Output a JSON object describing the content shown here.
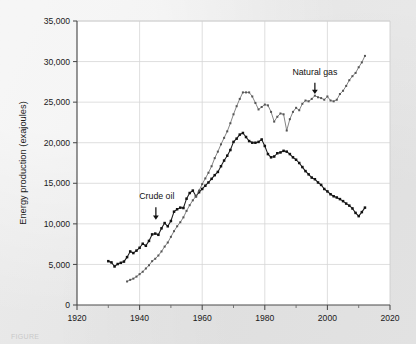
{
  "figure": {
    "background_color": "#e9e9e9",
    "plot_background_color": "#ffffff",
    "caption_fragment": "FIGURE"
  },
  "chart_data": {
    "type": "line",
    "title": "",
    "xlabel": "",
    "ylabel": "Energy production (exajoules)",
    "xlim": [
      1920,
      2020
    ],
    "ylim": [
      0,
      35000
    ],
    "xticks": [
      1920,
      1940,
      1960,
      1980,
      2000,
      2020
    ],
    "xtick_labels": [
      "1920",
      "1940",
      "1960",
      "1980",
      "2000",
      "2020"
    ],
    "xminor_ticks": [
      1930,
      1950,
      1970,
      1990,
      2010
    ],
    "yticks": [
      0,
      5000,
      10000,
      15000,
      20000,
      25000,
      30000,
      35000
    ],
    "ytick_labels": [
      "0",
      "5,000",
      "10,000",
      "15,000",
      "20,000",
      "25,000",
      "30,000",
      "35,000"
    ],
    "grid": "horizontal-and-vertical",
    "legend": "none",
    "marker": "square",
    "annotations": [
      {
        "label": "Crude oil",
        "text_x": 1945.5,
        "text_y": 13050,
        "arrow_from_y": 12050,
        "arrow_to_x": 1945.2,
        "arrow_to_y": 10500,
        "color": "#111111"
      },
      {
        "label": "Natural gas",
        "text_x": 1996.0,
        "text_y": 28300,
        "arrow_from_y": 27400,
        "arrow_to_x": 1996.0,
        "arrow_to_y": 26000,
        "color": "#111111"
      }
    ],
    "series": [
      {
        "name": "Crude oil",
        "color": "#1b1b1b",
        "marker_color": "#111111",
        "x": [
          1930,
          1931,
          1932,
          1933,
          1934,
          1935,
          1936,
          1937,
          1938,
          1939,
          1940,
          1941,
          1942,
          1943,
          1944,
          1945,
          1946,
          1947,
          1948,
          1949,
          1950,
          1951,
          1952,
          1953,
          1954,
          1955,
          1956,
          1957,
          1958,
          1959,
          1960,
          1961,
          1962,
          1963,
          1964,
          1965,
          1966,
          1967,
          1968,
          1969,
          1970,
          1971,
          1972,
          1973,
          1974,
          1975,
          1976,
          1977,
          1978,
          1979,
          1980,
          1981,
          1982,
          1983,
          1984,
          1985,
          1986,
          1987,
          1988,
          1989,
          1990,
          1991,
          1992,
          1993,
          1994,
          1995,
          1996,
          1997,
          1998,
          1999,
          2000,
          2001,
          2002,
          2003,
          2004,
          2005,
          2006,
          2007,
          2008,
          2009,
          2010,
          2011,
          2012
        ],
        "values": [
          5400,
          5250,
          4750,
          5050,
          5200,
          5350,
          5900,
          6600,
          6400,
          6700,
          7050,
          7550,
          7300,
          7900,
          8700,
          8800,
          8650,
          9450,
          10100,
          9700,
          10350,
          11500,
          11800,
          12000,
          11950,
          13100,
          13800,
          14100,
          13400,
          13900,
          14300,
          14700,
          15100,
          15550,
          16000,
          16400,
          17100,
          17800,
          18400,
          19100,
          20100,
          20500,
          21000,
          21200,
          20700,
          20200,
          20000,
          20000,
          20100,
          20400,
          19600,
          18600,
          18200,
          18300,
          18700,
          18800,
          19000,
          18900,
          18600,
          18200,
          17900,
          17500,
          17000,
          16500,
          16100,
          15700,
          15500,
          15100,
          14800,
          14300,
          14000,
          13650,
          13400,
          13250,
          13050,
          12800,
          12500,
          12250,
          11900,
          11350,
          10950,
          11450,
          12000
        ]
      },
      {
        "name": "Natural gas",
        "color": "#6e6e6e",
        "marker_color": "#555555",
        "x": [
          1936,
          1937,
          1938,
          1939,
          1940,
          1941,
          1942,
          1943,
          1944,
          1945,
          1946,
          1947,
          1948,
          1949,
          1950,
          1951,
          1952,
          1953,
          1954,
          1955,
          1956,
          1957,
          1958,
          1959,
          1960,
          1961,
          1962,
          1963,
          1964,
          1965,
          1966,
          1967,
          1968,
          1969,
          1970,
          1971,
          1972,
          1973,
          1974,
          1975,
          1976,
          1977,
          1978,
          1979,
          1980,
          1981,
          1982,
          1983,
          1984,
          1985,
          1986,
          1987,
          1988,
          1989,
          1990,
          1991,
          1992,
          1993,
          1994,
          1995,
          1996,
          1997,
          1998,
          1999,
          2000,
          2001,
          2002,
          2003,
          2004,
          2005,
          2006,
          2007,
          2008,
          2009,
          2010,
          2011,
          2012
        ],
        "values": [
          2900,
          3100,
          3250,
          3500,
          3800,
          4100,
          4500,
          4900,
          5400,
          5700,
          6100,
          6600,
          7200,
          7700,
          8400,
          9100,
          9700,
          10200,
          10800,
          11600,
          12300,
          12900,
          13400,
          14100,
          14900,
          15600,
          16300,
          17100,
          18100,
          18900,
          19800,
          20600,
          21400,
          22400,
          23500,
          24500,
          25400,
          26200,
          26200,
          26200,
          25700,
          24900,
          24100,
          24400,
          24700,
          24600,
          23800,
          22600,
          23200,
          23600,
          23500,
          21500,
          22900,
          23800,
          24300,
          24000,
          24800,
          25200,
          25100,
          25400,
          25800,
          25600,
          25500,
          25300,
          25700,
          25200,
          25100,
          25300,
          26000,
          26400,
          27000,
          27700,
          28200,
          28600,
          29300,
          29900,
          30700
        ]
      }
    ]
  },
  "axes": {
    "y_title": "Energy production (exajoules)"
  }
}
